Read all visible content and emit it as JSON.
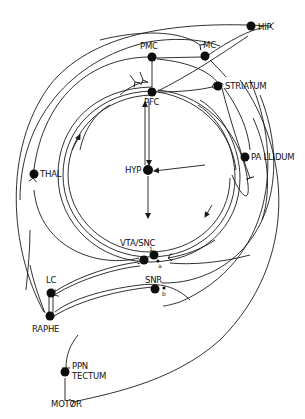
{
  "diagram": {
    "type": "neural-circuit-schematic",
    "nodes": [
      {
        "id": "hip",
        "label": "HIP"
      },
      {
        "id": "pmc",
        "label": "PMC"
      },
      {
        "id": "mc",
        "label": "MC"
      },
      {
        "id": "striatum",
        "label": "STRIATUM"
      },
      {
        "id": "pfc",
        "label": "PFC"
      },
      {
        "id": "thal",
        "label": "THAL"
      },
      {
        "id": "hyp",
        "label": "HYP"
      },
      {
        "id": "pallidum",
        "label": "PA LLIDUM"
      },
      {
        "id": "vta_snc",
        "label": "VTA/SNC"
      },
      {
        "id": "snr",
        "label": "SNR"
      },
      {
        "id": "lc",
        "label": "LC"
      },
      {
        "id": "raphe",
        "label": "RAPHE"
      },
      {
        "id": "ppn",
        "label": "PPN"
      },
      {
        "id": "tectum",
        "label": "TECTUM"
      },
      {
        "id": "motor",
        "label": "MOTOR"
      }
    ],
    "small_labels": {
      "vta_1": "1",
      "vta_2": "2",
      "a": "a",
      "b": "b"
    },
    "colors": {
      "line": "#1a1a1a",
      "node": "#0d0d0d",
      "background": "#ffffff"
    }
  }
}
